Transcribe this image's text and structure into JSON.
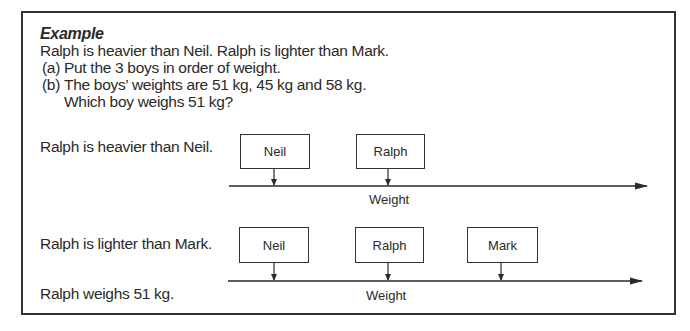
{
  "example": {
    "heading": "Example",
    "statement": "Ralph is heavier than Neil. Ralph is lighter than Mark.",
    "questions": [
      {
        "label": "(a)",
        "text": "Put the 3 boys in order of weight."
      },
      {
        "label": "(b)",
        "text": "The boys’ weights are 51 kg, 45 kg and 58 kg.",
        "text2": "Which boy weighs 51 kg?"
      }
    ]
  },
  "diagram1": {
    "caption": "Ralph is heavier than Neil.",
    "boxes": [
      "Neil",
      "Ralph"
    ],
    "axis_label": "Weight"
  },
  "diagram2": {
    "caption": "Ralph is lighter than Mark.",
    "caption2": "Ralph weighs 51 kg.",
    "boxes": [
      "Neil",
      "Ralph",
      "Mark"
    ],
    "axis_label": "Weight"
  },
  "colors": {
    "ink": "#2a2a2a",
    "border": "#333333",
    "background": "#ffffff"
  }
}
